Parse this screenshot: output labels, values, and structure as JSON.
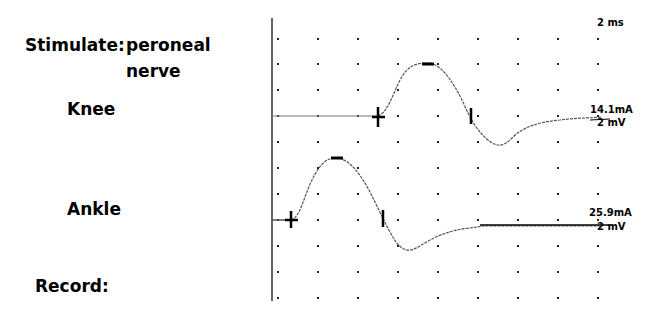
{
  "labels": {
    "stimulate": "Stimulate:",
    "stimulate_site_line1": "peroneal",
    "stimulate_site_line2": "nerve",
    "knee": "Knee",
    "ankle": "Ankle",
    "record": "Record:"
  },
  "scales": {
    "time_per_division": "2 ms",
    "knee_stimulus": "14.1mA",
    "knee_gain": "2 mV",
    "ankle_stimulus": "25.9mA",
    "ankle_gain": "2 mV"
  },
  "colors": {
    "trace": "#555555",
    "axis": "#333333",
    "grid_dot": "#222222",
    "marker": "#000000",
    "background": "#ffffff"
  },
  "chart_data": {
    "type": "line",
    "xlabel": "Time (2 ms/div)",
    "ylabel": "Amplitude (2 mV/div)",
    "grid": "dotted",
    "x_divisions": 8.5,
    "y_divisions": 10,
    "series": [
      {
        "name": "Knee",
        "stimulus": "14.1mA",
        "gain": "2 mV",
        "x_ms": [
          0,
          5.2,
          5.8,
          6.4,
          7.0,
          7.6,
          8.2,
          8.8,
          9.4,
          10.0,
          10.6,
          11.2,
          11.8,
          12.4,
          13.0,
          14.0,
          15.0,
          16.0
        ],
        "y_mv": [
          0,
          0,
          0.7,
          2.2,
          3.4,
          4.0,
          3.5,
          2.3,
          0.8,
          -0.6,
          -1.8,
          -2.2,
          -1.8,
          -1.1,
          -0.6,
          -0.3,
          -0.1,
          0
        ],
        "markers": {
          "onset_ms": 5.2,
          "negative_peak_ms": 7.6,
          "negative_peak_mv": 4.0,
          "crossing_ms": 9.8
        }
      },
      {
        "name": "Ankle",
        "stimulus": "25.9mA",
        "gain": "2 mV",
        "x_ms": [
          0,
          0.6,
          1.2,
          1.8,
          2.4,
          3.0,
          3.6,
          4.2,
          4.8,
          5.4,
          6.0,
          6.6,
          7.2,
          7.8,
          8.4,
          9.0,
          10.0,
          12.0,
          16.0
        ],
        "y_mv": [
          0,
          0,
          0.5,
          2.0,
          3.6,
          4.6,
          4.4,
          3.4,
          2.0,
          0.6,
          -0.6,
          -1.8,
          -2.4,
          -2.2,
          -1.4,
          -0.6,
          -0.3,
          -0.1,
          0
        ],
        "markers": {
          "onset_ms": 0.9,
          "negative_peak_ms": 3.2,
          "negative_peak_mv": 4.6,
          "crossing_ms": 5.6
        }
      }
    ]
  }
}
